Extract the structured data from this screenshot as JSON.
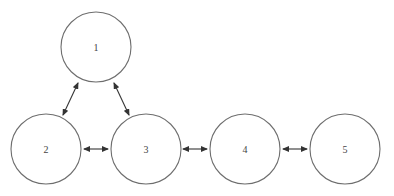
{
  "diagram": {
    "type": "graph",
    "colors": {
      "background": "#ffffff",
      "node_stroke": "#6e6e6e",
      "edge_stroke": "#333333",
      "label": "#444444"
    },
    "nodes": [
      {
        "id": "1",
        "label": "1",
        "cx": 96,
        "cy": 47,
        "r": 35
      },
      {
        "id": "2",
        "label": "2",
        "cx": 46,
        "cy": 149,
        "r": 35
      },
      {
        "id": "3",
        "label": "3",
        "cx": 146,
        "cy": 149,
        "r": 35
      },
      {
        "id": "4",
        "label": "4",
        "cx": 245,
        "cy": 149,
        "r": 35
      },
      {
        "id": "5",
        "label": "5",
        "cx": 345,
        "cy": 149,
        "r": 35
      }
    ],
    "edges": [
      {
        "from": "1",
        "to": "2",
        "direction": "bidirectional",
        "x1": 78,
        "y1": 83,
        "x2": 63,
        "y2": 115
      },
      {
        "from": "1",
        "to": "3",
        "direction": "bidirectional",
        "x1": 114,
        "y1": 83,
        "x2": 129,
        "y2": 115
      },
      {
        "from": "2",
        "to": "3",
        "direction": "bidirectional",
        "x1": 84,
        "y1": 149,
        "x2": 108,
        "y2": 149
      },
      {
        "from": "3",
        "to": "4",
        "direction": "bidirectional",
        "x1": 183,
        "y1": 149,
        "x2": 207,
        "y2": 149
      },
      {
        "from": "4",
        "to": "5",
        "direction": "bidirectional",
        "x1": 283,
        "y1": 149,
        "x2": 307,
        "y2": 149
      }
    ]
  }
}
